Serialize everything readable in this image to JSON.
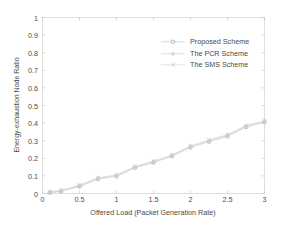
{
  "chart_data": {
    "type": "scatter",
    "title": "",
    "xlabel": "Offered Load (Packet Generation Rate)",
    "ylabel": "Energy-exhaustion Node Ratio",
    "xlim": [
      0,
      3
    ],
    "ylim": [
      0,
      1
    ],
    "xticks": [
      "0",
      "0.5",
      "1",
      "1.5",
      "2",
      "2.5",
      "3"
    ],
    "xtick_values": [
      0,
      0.5,
      1,
      1.5,
      2,
      2.5,
      3
    ],
    "yticks": [
      "0",
      "0.1",
      "0.2",
      "0.3",
      "0.4",
      "0.5",
      "0.6",
      "0.7",
      "0.8",
      "0.9",
      "1"
    ],
    "ytick_values": [
      0,
      0.1,
      0.2,
      0.3,
      0.4,
      0.5,
      0.6,
      0.7,
      0.8,
      0.9,
      1
    ],
    "grid": false,
    "legend_position": "upper-right-inside",
    "legend": [
      "Proposed Scheme",
      "The PCR Scheme",
      "The SMS Scheme"
    ],
    "x": [
      0.1,
      0.25,
      0.5,
      0.75,
      1.0,
      1.25,
      1.5,
      1.75,
      2.0,
      2.25,
      2.5,
      2.75,
      3.0
    ],
    "series": [
      {
        "name": "Proposed Scheme",
        "marker": "dot",
        "color": "#b9b9b9",
        "values": [
          0.005,
          0.012,
          0.04,
          0.082,
          0.098,
          0.146,
          0.176,
          0.212,
          0.262,
          0.295,
          0.325,
          0.378,
          0.405
        ]
      },
      {
        "name": "The PCR Scheme",
        "marker": "plus",
        "color": "#c4c4c4",
        "values": [
          0.007,
          0.015,
          0.044,
          0.086,
          0.102,
          0.15,
          0.18,
          0.216,
          0.266,
          0.3,
          0.33,
          0.382,
          0.41
        ]
      },
      {
        "name": "The SMS Scheme",
        "marker": "cross",
        "color": "#cfcfcf",
        "values": [
          0.01,
          0.018,
          0.048,
          0.09,
          0.106,
          0.154,
          0.184,
          0.22,
          0.27,
          0.305,
          0.335,
          0.386,
          0.415
        ]
      }
    ]
  },
  "axes": {
    "frame_color": "#d8d8d8",
    "tick_color": "#c8c8c8",
    "text_color": "#4a4a4a"
  }
}
